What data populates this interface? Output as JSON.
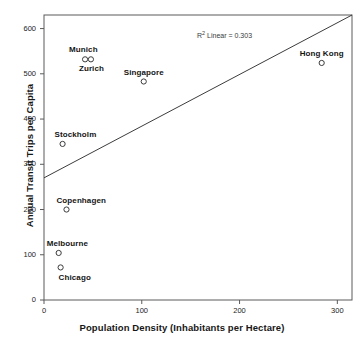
{
  "chart_data": {
    "type": "scatter",
    "title": "",
    "xlabel": "Population Density (Inhabitants per Hectare)",
    "ylabel": "Annual Transit Trips per Capita",
    "xlim": [
      0,
      315
    ],
    "ylim": [
      0,
      630
    ],
    "xticks": [
      0,
      100,
      200,
      300
    ],
    "yticks": [
      0,
      100,
      200,
      300,
      400,
      500,
      600
    ],
    "grid": false,
    "legend": null,
    "annotation": {
      "text": "R² Linear = 0.303",
      "r_squared": 0.303,
      "prefix": "R",
      "superscript": "2",
      "suffix": " Linear = 0.303"
    },
    "points": [
      {
        "label": "Munich",
        "x": 42,
        "y": 532,
        "label_dx": -16,
        "label_dy": -14
      },
      {
        "label": "Zurich",
        "x": 48,
        "y": 532,
        "label_dx": -12,
        "label_dy": 5
      },
      {
        "label": "Singapore",
        "x": 102,
        "y": 483,
        "label_dx": -20,
        "label_dy": -14
      },
      {
        "label": "Hong Kong",
        "x": 284,
        "y": 524,
        "label_dx": -22,
        "label_dy": -14
      },
      {
        "label": "Stockholm",
        "x": 19,
        "y": 345,
        "label_dx": -8,
        "label_dy": -14
      },
      {
        "label": "Copenhagen",
        "x": 23,
        "y": 200,
        "label_dx": -10,
        "label_dy": -14
      },
      {
        "label": "Melbourne",
        "x": 15,
        "y": 104,
        "label_dx": -12,
        "label_dy": -14
      },
      {
        "label": "Chicago",
        "x": 17,
        "y": 72,
        "label_dx": -2,
        "label_dy": 6
      }
    ],
    "fit_line": {
      "type": "linear",
      "x_start": 0,
      "y_start": 270,
      "x_end": 315,
      "y_end": 630
    },
    "marker": {
      "shape": "open-circle",
      "radius_px": 2.6,
      "stroke_color": "#3c3c3c",
      "fill": "none"
    },
    "style": {
      "axis_color": "#5a5a5a",
      "line_color": "#3c3c3c",
      "background": "#ffffff"
    }
  },
  "caption_strip": " "
}
